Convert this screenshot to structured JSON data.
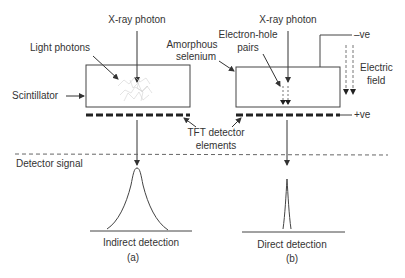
{
  "panel_a": {
    "xray_label": "X-ray photon",
    "light_label": "Light photons",
    "scintillator_label": "Scintillator",
    "caption": "Indirect detection",
    "tag": "(a)"
  },
  "panel_b": {
    "xray_label": "X-ray photon",
    "eh_label_1": "Electron-hole",
    "eh_label_2": "pairs",
    "se_label_1": "Amorphous",
    "se_label_2": "selenium",
    "neg_label": "–ve",
    "pos_label": "+ve",
    "field_label_1": "Electric",
    "field_label_2": "field",
    "caption": "Direct detection",
    "tag": "(b)"
  },
  "shared": {
    "tft_label_1": "TFT detector",
    "tft_label_2": "elements",
    "signal_label": "Detector signal"
  },
  "colors": {
    "stroke": "#333333",
    "dash": "#555555",
    "light_scatter": "#cfcfcf"
  }
}
